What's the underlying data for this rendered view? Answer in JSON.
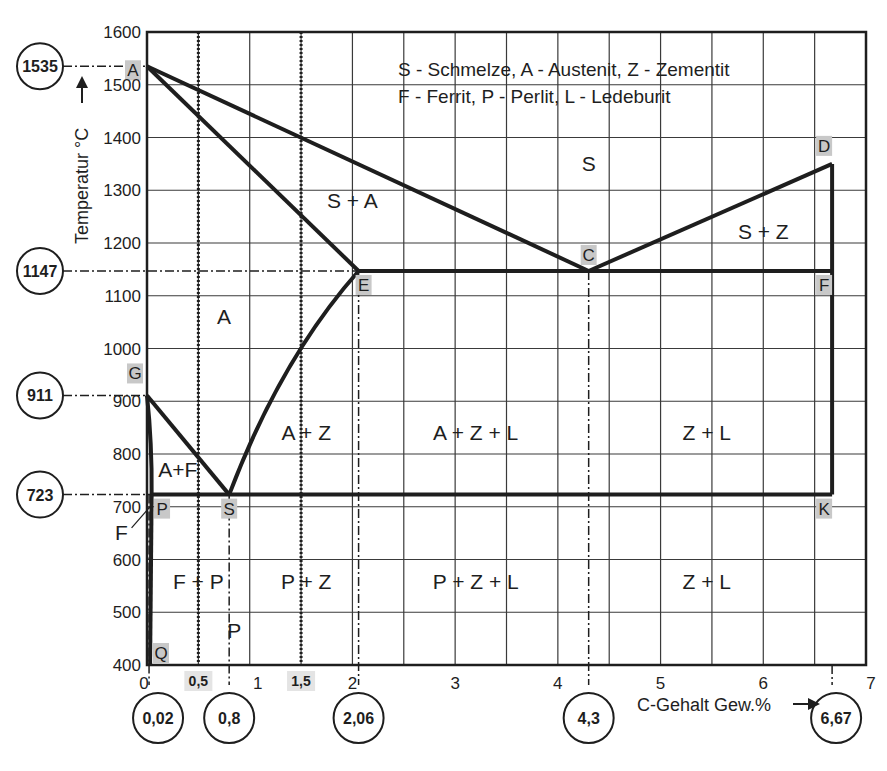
{
  "chart_data": {
    "type": "diagram",
    "xlabel": "C-Gehalt Gew.%",
    "ylabel": "Temperatur °C",
    "xlim": [
      0,
      7
    ],
    "ylim": [
      400,
      1600
    ],
    "grid": true,
    "x_ticks": [
      {
        "v": 0,
        "label": "0"
      },
      {
        "v": 1,
        "label": "1"
      },
      {
        "v": 2,
        "label": "2"
      },
      {
        "v": 3,
        "label": "3"
      },
      {
        "v": 4,
        "label": "4"
      },
      {
        "v": 5,
        "label": "5"
      },
      {
        "v": 6,
        "label": "6"
      },
      {
        "v": 7,
        "label": "7"
      }
    ],
    "x_ticks_highlighted": [
      {
        "v": 0.5,
        "label": "0,5"
      },
      {
        "v": 1.5,
        "label": "1,5"
      }
    ],
    "y_ticks": [
      400,
      500,
      600,
      700,
      800,
      900,
      1000,
      1100,
      1200,
      1300,
      1400,
      1500,
      1600
    ],
    "points": [
      {
        "name": "A",
        "x": 0,
        "y": 1535
      },
      {
        "name": "C",
        "x": 4.3,
        "y": 1147
      },
      {
        "name": "D",
        "x": 6.67,
        "y": 1350
      },
      {
        "name": "E",
        "x": 2.06,
        "y": 1147
      },
      {
        "name": "F",
        "x": 6.67,
        "y": 1147
      },
      {
        "name": "G",
        "x": 0,
        "y": 911
      },
      {
        "name": "K",
        "x": 6.67,
        "y": 723
      },
      {
        "name": "P",
        "x": 0.02,
        "y": 723
      },
      {
        "name": "S",
        "x": 0.8,
        "y": 723
      },
      {
        "name": "Q",
        "x": 0.0,
        "y": 400
      }
    ],
    "lines": [
      {
        "name": "liquidus-AC",
        "from": "A",
        "to": "C"
      },
      {
        "name": "liquidus-CD",
        "from": "C",
        "to": "D"
      },
      {
        "name": "solidus-AE",
        "from": "A",
        "to": "E"
      },
      {
        "name": "eutectic-ECF",
        "from": "E",
        "to": "F"
      },
      {
        "name": "acm-ES",
        "from": "E",
        "to": "S"
      },
      {
        "name": "a3-GS",
        "from": "G",
        "to": "S"
      },
      {
        "name": "eutectoid-PSK",
        "from": "P",
        "to": "K"
      },
      {
        "name": "GP",
        "from": "G",
        "to": "P"
      },
      {
        "name": "PQ",
        "from": "P",
        "to": "Q"
      },
      {
        "name": "DK",
        "from": "D",
        "to": "K"
      }
    ],
    "regions": [
      {
        "label": "S",
        "x": 4.3,
        "y": 1350
      },
      {
        "label": "S + A",
        "x": 2.0,
        "y": 1280
      },
      {
        "label": "S + Z",
        "x": 6.0,
        "y": 1220
      },
      {
        "label": "A",
        "x": 0.75,
        "y": 1060
      },
      {
        "label": "A + Z",
        "x": 1.55,
        "y": 840
      },
      {
        "label": "A + Z + L",
        "x": 3.2,
        "y": 840
      },
      {
        "label": "Z + L",
        "x": 5.45,
        "y": 840
      },
      {
        "label": "A+F",
        "x": 0.3,
        "y": 770
      },
      {
        "label": "F",
        "x": -0.25,
        "y": 650
      },
      {
        "label": "F + P",
        "x": 0.5,
        "y": 558
      },
      {
        "label": "P",
        "x": 0.85,
        "y": 465
      },
      {
        "label": "P + Z",
        "x": 1.55,
        "y": 558
      },
      {
        "label": "P + Z + L",
        "x": 3.2,
        "y": 558
      },
      {
        "label": "Z + L",
        "x": 5.45,
        "y": 558
      }
    ],
    "reference_lines": [
      {
        "type": "vertical-dotted",
        "x": 0.5
      },
      {
        "type": "vertical-dotted",
        "x": 1.5
      },
      {
        "type": "vertical-dashdot",
        "x": 0.8
      },
      {
        "type": "vertical-dashdot",
        "x": 2.06
      },
      {
        "type": "vertical-dashdot",
        "x": 4.3
      },
      {
        "type": "vertical-dashdot",
        "x": 6.67
      },
      {
        "type": "vertical-dashdot",
        "x": 0.02
      }
    ],
    "circled_temperatures": [
      {
        "value": 1535,
        "label": "1535"
      },
      {
        "value": 1147,
        "label": "1147"
      },
      {
        "value": 911,
        "label": "911"
      },
      {
        "value": 723,
        "label": "723"
      }
    ],
    "circled_concentrations": [
      {
        "value": 0.02,
        "label": "0,02"
      },
      {
        "value": 0.8,
        "label": "0,8"
      },
      {
        "value": 2.06,
        "label": "2,06"
      },
      {
        "value": 4.3,
        "label": "4,3"
      },
      {
        "value": 6.67,
        "label": "6,67"
      }
    ],
    "legend": [
      "S - Schmelze, A - Austenit, Z - Zementit",
      "F - Ferrit, P - Perlit, L - Ledeburit"
    ],
    "ylabel_arrow": "→",
    "xlabel_arrow": "→"
  },
  "colors": {
    "ink": "#1e1e1e",
    "grid": "#3a3a3a",
    "point_bg": "#c8c8c8",
    "background": "#ffffff"
  }
}
